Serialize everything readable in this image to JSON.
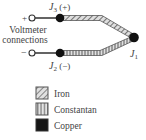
{
  "diagram": {
    "junctions": {
      "j3": {
        "label": "J",
        "sub": "3",
        "suffix": " (+)"
      },
      "j2": {
        "label": "J",
        "sub": "2",
        "suffix": " (−)"
      },
      "j1": {
        "label": "J",
        "sub": "1"
      }
    },
    "terminals": {
      "plus": "+",
      "minus": "−"
    },
    "voltmeter_label_line1": "Voltmeter",
    "voltmeter_label_line2": "connections"
  },
  "legend": {
    "items": [
      {
        "label": "Iron",
        "pattern": "diagonal-hatch"
      },
      {
        "label": "Constantan",
        "pattern": "vertical-stripes"
      },
      {
        "label": "Copper",
        "pattern": "solid-black"
      }
    ]
  },
  "colors": {
    "wire": "#222222",
    "junction": "#111111",
    "hatch_bg": "#d9d9d9",
    "hatch_line": "#555555",
    "copper": "#151515"
  }
}
